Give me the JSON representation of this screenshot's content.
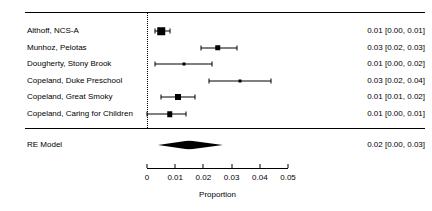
{
  "chart_data": {
    "type": "forest",
    "title": "",
    "xlabel": "Proportion",
    "ylabel": "",
    "xlim": [
      0,
      0.05
    ],
    "xticks": [
      "0",
      "0.01",
      "0.02",
      "0.03",
      "0.04",
      "0.05"
    ],
    "xtick_values": [
      0,
      0.01,
      0.02,
      0.03,
      0.04,
      0.05
    ],
    "grid": false,
    "reference_line": 0,
    "estimate_column_header": "",
    "studies": [
      {
        "label": "Althoff, NCS-A",
        "estimate": 0.005,
        "ci_low": 0.003,
        "ci_high": 0.008,
        "weight_box": 7.5,
        "estimate_text": "0.01 [0.00, 0.01]"
      },
      {
        "label": "Munhoz, Pelotas",
        "estimate": 0.025,
        "ci_low": 0.019,
        "ci_high": 0.032,
        "weight_box": 5.5,
        "estimate_text": "0.03 [0.02, 0.03]"
      },
      {
        "label": "Dougherty, Stony Brook",
        "estimate": 0.013,
        "ci_low": 0.003,
        "ci_high": 0.023,
        "weight_box": 3.0,
        "estimate_text": "0.01 [0.00, 0.02]"
      },
      {
        "label": "Copeland, Duke Preschool",
        "estimate": 0.033,
        "ci_low": 0.022,
        "ci_high": 0.044,
        "weight_box": 3.0,
        "estimate_text": "0.03 [0.02, 0.04]"
      },
      {
        "label": "Copeland, Great Smoky",
        "estimate": 0.011,
        "ci_low": 0.005,
        "ci_high": 0.017,
        "weight_box": 6.0,
        "estimate_text": "0.01 [0.01, 0.02]"
      },
      {
        "label": "Copeland, Caring for Children",
        "estimate": 0.008,
        "ci_low": 0.0,
        "ci_high": 0.014,
        "weight_box": 5.5,
        "estimate_text": "0.01 [0.00, 0.01]"
      }
    ],
    "summary": {
      "label": "RE Model",
      "estimate": 0.015,
      "ci_low": 0.004,
      "ci_high": 0.027,
      "estimate_text": "0.02 [0.00, 0.03]"
    }
  },
  "colors": {
    "foreground": "#000000",
    "background": "#ffffff"
  }
}
